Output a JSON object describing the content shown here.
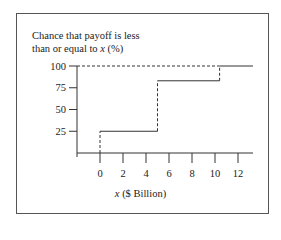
{
  "chart_data": {
    "type": "line",
    "subtype": "step-cumulative",
    "title": "",
    "ylabel_line1": "Chance that payoff is less",
    "ylabel_line2_prefix": "than or equal to ",
    "ylabel_var": "x",
    "ylabel_suffix": " (%)",
    "xlabel_var": "x",
    "xlabel_suffix": " ($ Billion)",
    "x_ticks": [
      0,
      2,
      4,
      6,
      8,
      10,
      12
    ],
    "y_ticks": [
      25,
      50,
      75,
      100
    ],
    "xlim": [
      -2,
      13
    ],
    "ylim": [
      0,
      100
    ],
    "grid": false,
    "legend": null,
    "series": [
      {
        "name": "Cumulative probability",
        "style": "solid",
        "steps": [
          {
            "x_start": 0,
            "x_end": 5,
            "y": 25
          },
          {
            "x_start": 5,
            "x_end": 10.4,
            "y": 83
          },
          {
            "x_start": 10.4,
            "x_end": 13,
            "y": 100
          }
        ]
      }
    ],
    "reference_lines": [
      {
        "type": "horizontal",
        "y": 100,
        "x_from": -2,
        "x_to": 10.4,
        "style": "dashed"
      },
      {
        "type": "vertical",
        "x": 0,
        "y_from": 0,
        "y_to": 25,
        "style": "dashed"
      },
      {
        "type": "vertical",
        "x": 5,
        "y_from": 25,
        "y_to": 83,
        "style": "dashed"
      },
      {
        "type": "vertical",
        "x": 10.4,
        "y_from": 83,
        "y_to": 100,
        "style": "dashed"
      }
    ]
  },
  "labels": {
    "y_ticks": [
      "100",
      "75",
      "50",
      "25"
    ],
    "x_ticks": [
      "0",
      "2",
      "4",
      "6",
      "8",
      "10",
      "12"
    ]
  }
}
